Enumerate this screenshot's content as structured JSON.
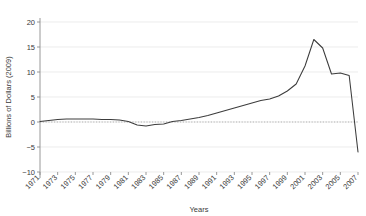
{
  "chart_data": {
    "type": "line",
    "title": "",
    "xlabel": "Years",
    "ylabel": "Billions of Dollars (2009)",
    "xlim": [
      1971,
      2007
    ],
    "ylim": [
      -10,
      20
    ],
    "yticks": [
      -10,
      -5,
      0,
      5,
      10,
      15,
      20
    ],
    "ytick_labels": [
      "−10",
      "−5",
      "0",
      "5",
      "10",
      "15",
      "20"
    ],
    "xticks": [
      1971,
      1973,
      1975,
      1977,
      1979,
      1981,
      1983,
      1985,
      1987,
      1989,
      1991,
      1993,
      1995,
      1997,
      1999,
      2001,
      2003,
      2005,
      2007
    ],
    "xtick_labels": [
      "1971",
      "1973",
      "1975",
      "1977",
      "1979",
      "1981",
      "1983",
      "1985",
      "1987",
      "1989",
      "1991",
      "1993",
      "1995",
      "1997",
      "1999",
      "2001",
      "2003",
      "2005",
      "2007"
    ],
    "grid": "horizontal",
    "legend": "none",
    "zero_reference_line": true,
    "line_color": "#3c3c3c",
    "grid_color": "#e4e4e4",
    "axis_color": "#8d8d8d",
    "x": [
      1971,
      1972,
      1973,
      1974,
      1975,
      1976,
      1977,
      1978,
      1979,
      1980,
      1981,
      1982,
      1983,
      1984,
      1985,
      1986,
      1987,
      1988,
      1989,
      1990,
      1991,
      1992,
      1993,
      1994,
      1995,
      1996,
      1997,
      1998,
      1999,
      2000,
      2001,
      2002,
      2003,
      2004,
      2005,
      2006,
      2007
    ],
    "values": [
      0.1,
      0.3,
      0.5,
      0.6,
      0.6,
      0.6,
      0.6,
      0.5,
      0.5,
      0.4,
      0.1,
      -0.6,
      -0.8,
      -0.5,
      -0.4,
      0.1,
      0.3,
      0.6,
      0.9,
      1.3,
      1.8,
      2.3,
      2.8,
      3.3,
      3.8,
      4.3,
      4.6,
      5.2,
      6.2,
      7.6,
      11.2,
      16.5,
      14.8,
      9.6,
      9.8,
      9.3,
      -6.0
    ]
  }
}
